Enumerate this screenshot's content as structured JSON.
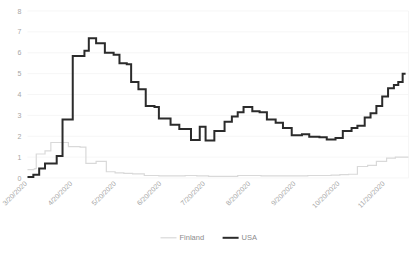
{
  "chart_data": {
    "type": "line",
    "title": "",
    "subtitle": "",
    "xlabel": "",
    "ylabel": "",
    "ylim": [
      0,
      8
    ],
    "ytick_values": [
      0,
      1,
      2,
      3,
      4,
      5,
      6,
      7,
      8
    ],
    "ytick_labels": [
      "0",
      "1",
      "2",
      "3",
      "4",
      "5",
      "6",
      "7",
      "8"
    ],
    "grid": true,
    "grid_axis": "y",
    "legend_position": "bottom",
    "line_style": "step",
    "x_tick_labels": [
      "3/20/2020",
      "4/20/2020",
      "5/20/2020",
      "6/20/2020",
      "7/20/2020",
      "8/20/2020",
      "9/20/2020",
      "10/20/2020",
      "11/20/2020"
    ],
    "x_tick_index": [
      0,
      31,
      61,
      92,
      122,
      153,
      184,
      214,
      245
    ],
    "x_start_label": "3/20/2020",
    "x_end_label": "12/6/2020",
    "n_points": 262,
    "series": [
      {
        "name": "Finland",
        "color": "#d9d9d9",
        "stroke_width": 1.2,
        "values": [
          0.4,
          0.4,
          0.4,
          0.4,
          0.42,
          0.45,
          1.15,
          1.15,
          1.15,
          1.15,
          1.15,
          1.15,
          1.3,
          1.3,
          1.3,
          1.3,
          1.7,
          1.7,
          1.7,
          1.7,
          1.7,
          1.7,
          1.7,
          1.7,
          1.7,
          1.7,
          1.7,
          1.7,
          1.5,
          1.5,
          1.5,
          1.5,
          1.5,
          1.5,
          1.5,
          1.5,
          1.48,
          1.48,
          1.48,
          1.48,
          0.7,
          0.7,
          0.7,
          0.7,
          0.7,
          0.7,
          0.7,
          0.8,
          0.8,
          0.8,
          0.8,
          0.8,
          0.8,
          0.8,
          0.3,
          0.3,
          0.3,
          0.3,
          0.3,
          0.3,
          0.25,
          0.25,
          0.25,
          0.25,
          0.25,
          0.25,
          0.22,
          0.22,
          0.22,
          0.22,
          0.22,
          0.22,
          0.2,
          0.2,
          0.2,
          0.2,
          0.2,
          0.2,
          0.2,
          0.2,
          0.12,
          0.12,
          0.12,
          0.12,
          0.12,
          0.12,
          0.12,
          0.12,
          0.12,
          0.12,
          0.1,
          0.1,
          0.1,
          0.1,
          0.1,
          0.1,
          0.1,
          0.1,
          0.1,
          0.1,
          0.1,
          0.1,
          0.1,
          0.1,
          0.1,
          0.1,
          0.1,
          0.1,
          0.12,
          0.12,
          0.12,
          0.12,
          0.12,
          0.12,
          0.12,
          0.12,
          0.1,
          0.1,
          0.1,
          0.1,
          0.1,
          0.1,
          0.1,
          0.1,
          0.08,
          0.08,
          0.08,
          0.08,
          0.08,
          0.08,
          0.08,
          0.08,
          0.08,
          0.08,
          0.08,
          0.08,
          0.08,
          0.08,
          0.08,
          0.08,
          0.08,
          0.08,
          0.08,
          0.08,
          0.12,
          0.12,
          0.12,
          0.12,
          0.12,
          0.12,
          0.12,
          0.12,
          0.12,
          0.12,
          0.12,
          0.12,
          0.12,
          0.12,
          0.12,
          0.12,
          0.1,
          0.1,
          0.1,
          0.1,
          0.1,
          0.1,
          0.1,
          0.1,
          0.1,
          0.1,
          0.1,
          0.1,
          0.1,
          0.1,
          0.1,
          0.1,
          0.1,
          0.1,
          0.1,
          0.1,
          0.1,
          0.1,
          0.1,
          0.1,
          0.1,
          0.1,
          0.1,
          0.1,
          0.1,
          0.1,
          0.1,
          0.1,
          0.12,
          0.12,
          0.12,
          0.12,
          0.12,
          0.12,
          0.12,
          0.12,
          0.12,
          0.12,
          0.12,
          0.12,
          0.12,
          0.12,
          0.12,
          0.12,
          0.14,
          0.14,
          0.14,
          0.14,
          0.14,
          0.14,
          0.16,
          0.16,
          0.16,
          0.16,
          0.16,
          0.16,
          0.18,
          0.18,
          0.18,
          0.18,
          0.18,
          0.18,
          0.55,
          0.55,
          0.55,
          0.55,
          0.55,
          0.55,
          0.55,
          0.6,
          0.6,
          0.6,
          0.6,
          0.6,
          0.6,
          0.8,
          0.8,
          0.8,
          0.8,
          0.8,
          0.8,
          0.8,
          0.95,
          0.95,
          0.95,
          0.95,
          0.95,
          0.95,
          1.0,
          1.0,
          1.0,
          1.0,
          1.0,
          1.0,
          1.0,
          1.0,
          1.0,
          1.0
        ]
      },
      {
        "name": "USA",
        "color": "#2b2b2b",
        "stroke_width": 2.0,
        "values": [
          0.05,
          0.05,
          0.05,
          0.05,
          0.15,
          0.15,
          0.15,
          0.15,
          0.45,
          0.45,
          0.45,
          0.45,
          0.7,
          0.7,
          0.7,
          0.7,
          0.7,
          0.7,
          0.7,
          0.7,
          1.05,
          1.05,
          1.05,
          1.05,
          2.8,
          2.8,
          2.8,
          2.8,
          2.8,
          2.8,
          2.8,
          5.85,
          5.85,
          5.85,
          5.85,
          5.85,
          5.85,
          5.85,
          5.85,
          6.1,
          6.1,
          6.1,
          6.7,
          6.7,
          6.7,
          6.7,
          6.7,
          6.45,
          6.45,
          6.45,
          6.45,
          6.45,
          6.45,
          6.0,
          6.0,
          6.0,
          6.0,
          6.0,
          6.0,
          5.9,
          5.9,
          5.9,
          5.9,
          5.5,
          5.5,
          5.5,
          5.5,
          5.5,
          5.45,
          5.45,
          5.45,
          4.6,
          4.6,
          4.6,
          4.6,
          4.6,
          4.25,
          4.25,
          4.25,
          4.25,
          4.25,
          3.45,
          3.45,
          3.45,
          3.45,
          3.45,
          3.45,
          3.4,
          3.4,
          3.4,
          2.85,
          2.85,
          2.85,
          2.85,
          2.85,
          2.85,
          2.85,
          2.85,
          2.55,
          2.55,
          2.55,
          2.55,
          2.55,
          2.55,
          2.35,
          2.35,
          2.35,
          2.35,
          2.35,
          2.35,
          2.35,
          2.35,
          1.82,
          1.82,
          1.82,
          1.82,
          1.82,
          1.82,
          2.45,
          2.45,
          2.45,
          2.45,
          1.8,
          1.8,
          1.8,
          1.8,
          1.8,
          1.8,
          2.25,
          2.25,
          2.25,
          2.25,
          2.25,
          2.25,
          2.25,
          2.7,
          2.7,
          2.7,
          2.7,
          2.7,
          2.95,
          2.95,
          2.95,
          2.95,
          3.15,
          3.15,
          3.15,
          3.15,
          3.4,
          3.4,
          3.4,
          3.4,
          3.4,
          3.4,
          3.2,
          3.2,
          3.2,
          3.2,
          3.2,
          3.15,
          3.15,
          3.15,
          3.15,
          3.15,
          2.8,
          2.8,
          2.8,
          2.8,
          2.8,
          2.8,
          2.65,
          2.65,
          2.65,
          2.65,
          2.65,
          2.4,
          2.4,
          2.4,
          2.4,
          2.4,
          2.4,
          2.05,
          2.05,
          2.05,
          2.05,
          2.05,
          2.05,
          2.05,
          2.1,
          2.1,
          2.1,
          2.1,
          2.1,
          1.98,
          1.98,
          1.98,
          1.98,
          1.98,
          1.98,
          1.98,
          1.95,
          1.95,
          1.95,
          1.95,
          1.95,
          1.85,
          1.85,
          1.85,
          1.85,
          1.85,
          1.85,
          1.92,
          1.92,
          1.92,
          1.92,
          1.92,
          2.25,
          2.25,
          2.25,
          2.25,
          2.25,
          2.25,
          2.4,
          2.4,
          2.4,
          2.4,
          2.5,
          2.5,
          2.5,
          2.5,
          2.5,
          2.9,
          2.9,
          2.9,
          2.9,
          3.1,
          3.1,
          3.1,
          3.1,
          3.45,
          3.45,
          3.45,
          3.45,
          3.9,
          3.9,
          3.9,
          3.9,
          4.3,
          4.3,
          4.3,
          4.3,
          4.45,
          4.45,
          4.45,
          4.6,
          4.6,
          4.6,
          5.0,
          5.0,
          5.0
        ]
      }
    ]
  },
  "legend": {
    "items": [
      {
        "label": "Finland",
        "color": "#d9d9d9"
      },
      {
        "label": "USA",
        "color": "#2b2b2b"
      }
    ]
  },
  "axes": {
    "y_max_label": "8",
    "y_min_label": "0"
  }
}
